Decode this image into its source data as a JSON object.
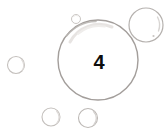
{
  "image": {
    "title": "Bubble count illustration",
    "width": 166,
    "height": 135,
    "background_color": "#ffffff",
    "bubble_count_shown": "4"
  },
  "label": {
    "text": "4",
    "color": "#0d0d0d",
    "font_size_px": 20,
    "center_x": 99,
    "center_y": 63
  },
  "style": {
    "outline_color": "#a39e9b",
    "outline_color_light": "#c9c5c2",
    "highlight_color": "#e6e3e1",
    "fill_color": "#ffffff"
  },
  "bubbles": [
    {
      "name": "main-bubble",
      "cx": 98,
      "cy": 60,
      "r": 40,
      "stroke": "#a39e9b",
      "stroke_width": 1.4,
      "contains_label": "4"
    },
    {
      "name": "top-right-bubble",
      "cx": 146,
      "cy": 25,
      "r": 17,
      "stroke": "#b5b1ae",
      "stroke_width": 1.2,
      "contains_label": ""
    },
    {
      "name": "left-bubble",
      "cx": 16,
      "cy": 65,
      "r": 8.5,
      "stroke": "#c4c0bd",
      "stroke_width": 1.1,
      "contains_label": ""
    },
    {
      "name": "bottom-left-bubble",
      "cx": 51,
      "cy": 117,
      "r": 9,
      "stroke": "#c4c0bd",
      "stroke_width": 1.1,
      "contains_label": ""
    },
    {
      "name": "bottom-right-bubble",
      "cx": 88,
      "cy": 118,
      "r": 9.5,
      "stroke": "#bcb8b5",
      "stroke_width": 1.1,
      "contains_label": ""
    },
    {
      "name": "tiny-top-bubble",
      "cx": 76,
      "cy": 19,
      "r": 4.5,
      "stroke": "#cac6c3",
      "stroke_width": 1,
      "contains_label": ""
    }
  ]
}
